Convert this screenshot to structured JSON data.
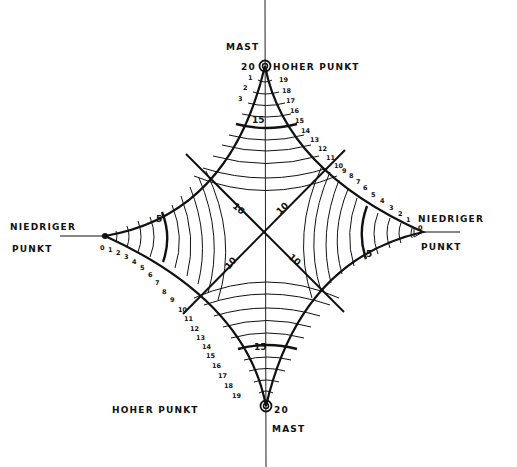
{
  "diagram": {
    "type": "hand-drawn contour diagram (monkey saddle / mast-point sketch)",
    "colors": {
      "ink": "#111111",
      "paper": "#ffffff"
    },
    "labels": {
      "top_mast": "MAST",
      "top_high_point": "HOHER PUNKT",
      "top_value": "20",
      "bottom_mast": "MAST",
      "bottom_high_point": "HOHER PUNKT",
      "bottom_value": "20",
      "left_low_1": "NIEDRIGER",
      "left_low_2": "PUNKT",
      "right_low_1": "NIEDRIGER",
      "right_low_2": "PUNKT"
    },
    "contour_labels": {
      "top_15": "15",
      "bottom_15": "15",
      "left_5": "5",
      "right_5": "5",
      "center_nw": "10",
      "center_ne": "10",
      "center_sw": "10",
      "center_se": "10"
    },
    "edge_ticks": {
      "top_right": [
        "19",
        "18",
        "17",
        "16",
        "15",
        "14",
        "13",
        "12",
        "11",
        "10"
      ],
      "top_left": [
        "1",
        "2",
        "3"
      ],
      "right_upper": [
        "9",
        "8",
        "7",
        "6",
        "5",
        "4",
        "3",
        "2",
        "1",
        "0"
      ],
      "left_lower": [
        "0",
        "1",
        "2",
        "3",
        "4",
        "5",
        "6",
        "7",
        "8",
        "9"
      ],
      "bottom_left": [
        "10",
        "11",
        "12",
        "13",
        "14",
        "15",
        "16",
        "17",
        "18",
        "19"
      ]
    }
  }
}
